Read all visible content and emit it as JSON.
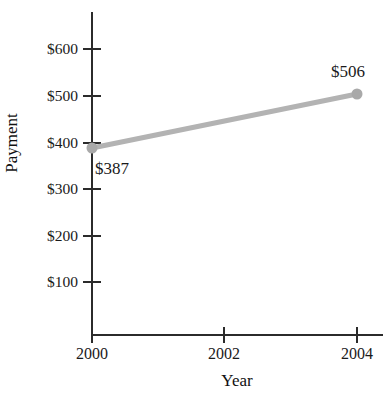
{
  "chart_data": {
    "type": "line",
    "title": "",
    "title_note": "cut off at top edge of image, not legible",
    "xlabel": "Year",
    "ylabel": "Payment",
    "x": [
      2000,
      2004
    ],
    "values": [
      387,
      506
    ],
    "point_labels": [
      "$387",
      "$506"
    ],
    "categories": [
      "2000",
      "2004"
    ],
    "xticks": [
      2000,
      2002,
      2004
    ],
    "xtick_labels": [
      "2000",
      "2002",
      "2004"
    ],
    "yticks": [
      100,
      200,
      300,
      400,
      500,
      600
    ],
    "ytick_labels": [
      "$100",
      "$200",
      "$300",
      "$400",
      "$500",
      "$600"
    ],
    "xlim": [
      2000,
      2004
    ],
    "ylim": [
      0,
      650
    ],
    "grid": false,
    "legend": false,
    "series": [
      {
        "name": "Payment",
        "values": [
          387,
          506
        ],
        "line_color": "#b3b3b3",
        "marker": "circle",
        "marker_color": "#a9a9a9"
      }
    ],
    "colors": {
      "line": "#b3b3b3",
      "marker": "#a9a9a9",
      "axis": "#2b2b2b",
      "text": "#1a1a1a",
      "background": "#ffffff"
    }
  },
  "geometry": {
    "x_px": [
      92,
      224,
      357
    ],
    "y_px_for": {
      "100": 281,
      "200": 235,
      "300": 188,
      "400": 142,
      "500": 95,
      "600": 48
    },
    "point_px": [
      {
        "x": 92,
        "y": 148
      },
      {
        "x": 357,
        "y": 94
      }
    ]
  }
}
